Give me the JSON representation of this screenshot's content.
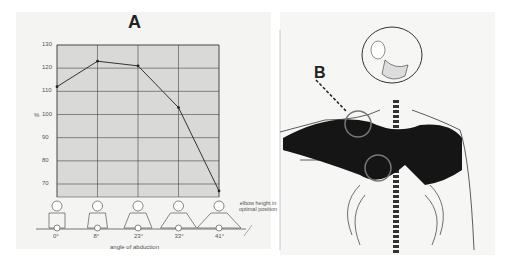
{
  "chart_data": {
    "type": "line",
    "title": "A",
    "xlabel": "angle of abduction",
    "ylabel": "%",
    "categories": [
      "0°",
      "8°",
      "23°",
      "33°",
      "41°"
    ],
    "x": [
      0,
      8,
      23,
      33,
      41
    ],
    "values": [
      112,
      123,
      121,
      103,
      67
    ],
    "yticks": [
      70,
      80,
      90,
      100,
      110,
      120,
      130
    ],
    "ylim": [
      65,
      130
    ],
    "grid": true,
    "annotation": "elbow height in optimal position"
  },
  "panel_b": {
    "label": "B",
    "description": "Anatomical drawing of upper torso skeleton with darkened chest muscles, two circled regions, dashed pointer from label B"
  }
}
